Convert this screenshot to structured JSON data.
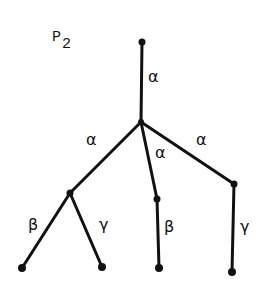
{
  "title": {
    "main": "P",
    "subscript": "2"
  },
  "nodes": [
    {
      "id": "root",
      "x": 142,
      "y": 42,
      "r": 3.5
    },
    {
      "id": "hub",
      "x": 141,
      "y": 122,
      "r": 3
    },
    {
      "id": "left",
      "x": 70,
      "y": 193,
      "r": 3.5
    },
    {
      "id": "mid",
      "x": 157,
      "y": 199,
      "r": 3.5
    },
    {
      "id": "right",
      "x": 234,
      "y": 184,
      "r": 3.5
    },
    {
      "id": "leaf1",
      "x": 22,
      "y": 268,
      "r": 4
    },
    {
      "id": "leaf2",
      "x": 102,
      "y": 267,
      "r": 4
    },
    {
      "id": "leaf3",
      "x": 159,
      "y": 268,
      "r": 4
    },
    {
      "id": "leaf4",
      "x": 232,
      "y": 272,
      "r": 4
    }
  ],
  "edges": [
    {
      "from": "root",
      "to": "hub",
      "label": "α",
      "lx": 148,
      "ly": 82
    },
    {
      "from": "hub",
      "to": "left",
      "label": "α",
      "lx": 86,
      "ly": 145
    },
    {
      "from": "hub",
      "to": "mid",
      "label": "α",
      "lx": 155,
      "ly": 158
    },
    {
      "from": "hub",
      "to": "right",
      "label": "α",
      "lx": 196,
      "ly": 145
    },
    {
      "from": "left",
      "to": "leaf1",
      "label": "β",
      "lx": 28,
      "ly": 230
    },
    {
      "from": "left",
      "to": "leaf2",
      "label": "γ",
      "lx": 99,
      "ly": 230
    },
    {
      "from": "mid",
      "to": "leaf3",
      "label": "β",
      "lx": 164,
      "ly": 232
    },
    {
      "from": "right",
      "to": "leaf4",
      "label": "γ",
      "lx": 240,
      "ly": 232
    }
  ]
}
